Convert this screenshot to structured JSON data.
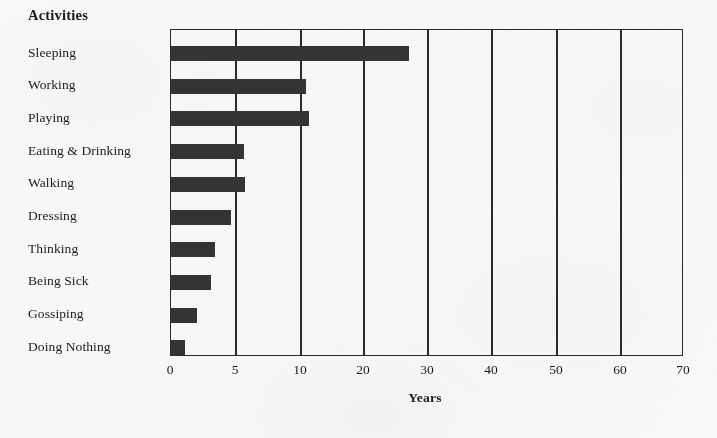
{
  "chart_data": {
    "type": "bar",
    "orientation": "horizontal",
    "title": "",
    "category_axis_title": "Activities",
    "xlabel": "Years",
    "ylabel": "",
    "categories": [
      "Sleeping",
      "Working",
      "Playing",
      "Eating & Drinking",
      "Walking",
      "Dressing",
      "Thinking",
      "Being Sick",
      "Gossiping",
      "Doing Nothing"
    ],
    "values": [
      27,
      10.8,
      11.2,
      5.6,
      5.7,
      4.6,
      3.4,
      3.1,
      2.0,
      1.1
    ],
    "xtick_labels": [
      "0",
      "5",
      "10",
      "20",
      "30",
      "40",
      "50",
      "60",
      "70"
    ],
    "xtick_values": [
      0,
      5,
      10,
      20,
      30,
      40,
      50,
      60,
      70
    ],
    "xlim": [
      0,
      70
    ],
    "axis_scale": "piecewise-compressed",
    "grid": "vertical-only",
    "legend": "none",
    "bar_color": "#343434",
    "axis_color": "#2a2a2a",
    "background_color": "#f8f8f6"
  },
  "geometry": {
    "plot_left": 170,
    "plot_right": 683,
    "plot_top": 29,
    "plot_bottom": 356,
    "tick_positions_px": [
      170,
      235,
      300,
      363,
      427,
      491,
      556,
      620,
      683
    ],
    "bar_height_px": 15,
    "row_pitch_px": 32.7,
    "first_bar_top_px": 45,
    "xtick_label_y_px": 362,
    "x_axis_title_y_px": 390,
    "x_axis_title_center_px": 425
  }
}
